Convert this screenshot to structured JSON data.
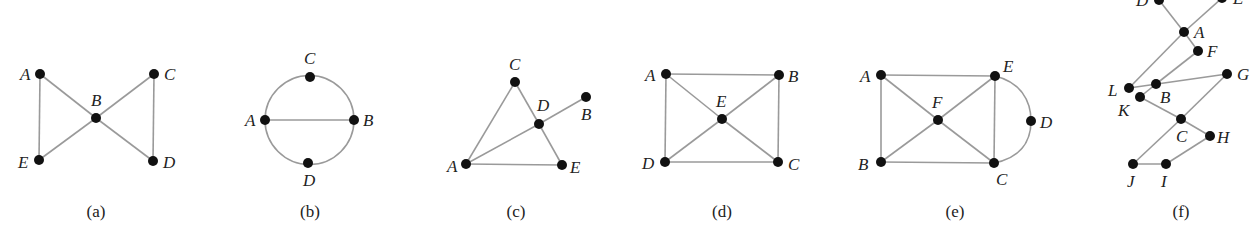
{
  "figure": {
    "graphs": [
      {
        "id": "a",
        "caption": "(a)",
        "caption_pos": [
          96,
          217
        ],
        "vertices": [
          {
            "name": "A",
            "x": 40,
            "y": 74,
            "lx": 20,
            "ly": 80
          },
          {
            "name": "B",
            "x": 96,
            "y": 118,
            "lx": 91,
            "ly": 106
          },
          {
            "name": "C",
            "x": 154,
            "y": 74,
            "lx": 164,
            "ly": 80
          },
          {
            "name": "D",
            "x": 153,
            "y": 161,
            "lx": 163,
            "ly": 168
          },
          {
            "name": "E",
            "x": 39,
            "y": 160,
            "lx": 18,
            "ly": 168
          }
        ],
        "edges": [
          [
            "A",
            "B"
          ],
          [
            "A",
            "E"
          ],
          [
            "B",
            "E"
          ],
          [
            "B",
            "C"
          ],
          [
            "B",
            "D"
          ],
          [
            "C",
            "D"
          ]
        ],
        "arcs": []
      },
      {
        "id": "b",
        "caption": "(b)",
        "caption_pos": [
          310,
          217
        ],
        "vertices": [
          {
            "name": "C",
            "x": 310,
            "y": 77,
            "lx": 304,
            "ly": 64
          },
          {
            "name": "A",
            "x": 265,
            "y": 120,
            "lx": 245,
            "ly": 126
          },
          {
            "name": "B",
            "x": 354,
            "y": 120,
            "lx": 363,
            "ly": 126
          },
          {
            "name": "D",
            "x": 308,
            "y": 163,
            "lx": 303,
            "ly": 186
          }
        ],
        "edges": [
          [
            "A",
            "B"
          ]
        ],
        "circle": {
          "cx": 309.5,
          "cy": 120,
          "r": 44.5
        }
      },
      {
        "id": "c",
        "caption": "(c)",
        "caption_pos": [
          516,
          217
        ],
        "vertices": [
          {
            "name": "C",
            "x": 515,
            "y": 82,
            "lx": 509,
            "ly": 70
          },
          {
            "name": "D",
            "x": 539,
            "y": 124,
            "lx": 537,
            "ly": 111
          },
          {
            "name": "B",
            "x": 586,
            "y": 97,
            "lx": 581,
            "ly": 120
          },
          {
            "name": "A",
            "x": 466,
            "y": 164,
            "lx": 447,
            "ly": 172
          },
          {
            "name": "E",
            "x": 562,
            "y": 165,
            "lx": 570,
            "ly": 173
          }
        ],
        "edges": [
          [
            "A",
            "C"
          ],
          [
            "C",
            "D"
          ],
          [
            "D",
            "E"
          ],
          [
            "A",
            "D"
          ],
          [
            "D",
            "B"
          ],
          [
            "A",
            "E"
          ]
        ],
        "arcs": []
      },
      {
        "id": "d",
        "caption": "(d)",
        "caption_pos": [
          722,
          217
        ],
        "vertices": [
          {
            "name": "A",
            "x": 666,
            "y": 74,
            "lx": 645,
            "ly": 81
          },
          {
            "name": "B",
            "x": 779,
            "y": 75,
            "lx": 788,
            "ly": 82
          },
          {
            "name": "E",
            "x": 722,
            "y": 119,
            "lx": 716,
            "ly": 107
          },
          {
            "name": "D",
            "x": 665,
            "y": 162,
            "lx": 642,
            "ly": 169
          },
          {
            "name": "C",
            "x": 778,
            "y": 162,
            "lx": 788,
            "ly": 170
          }
        ],
        "edges": [
          [
            "A",
            "B"
          ],
          [
            "A",
            "D"
          ],
          [
            "B",
            "C"
          ],
          [
            "D",
            "C"
          ],
          [
            "A",
            "E"
          ],
          [
            "E",
            "C"
          ],
          [
            "B",
            "E"
          ],
          [
            "E",
            "D"
          ]
        ],
        "arcs": []
      },
      {
        "id": "e",
        "caption": "(e)",
        "caption_pos": [
          955,
          217
        ],
        "vertices": [
          {
            "name": "A",
            "x": 881,
            "y": 75,
            "lx": 860,
            "ly": 82
          },
          {
            "name": "E",
            "x": 995,
            "y": 76,
            "lx": 1003,
            "ly": 72
          },
          {
            "name": "F",
            "x": 938,
            "y": 120,
            "lx": 932,
            "ly": 108
          },
          {
            "name": "D",
            "x": 1031,
            "y": 121,
            "lx": 1040,
            "ly": 128
          },
          {
            "name": "B",
            "x": 881,
            "y": 162,
            "lx": 858,
            "ly": 170
          },
          {
            "name": "C",
            "x": 994,
            "y": 163,
            "lx": 996,
            "ly": 185
          }
        ],
        "edges": [
          [
            "A",
            "E"
          ],
          [
            "A",
            "B"
          ],
          [
            "B",
            "C"
          ],
          [
            "E",
            "C"
          ],
          [
            "A",
            "F"
          ],
          [
            "F",
            "C"
          ],
          [
            "E",
            "F"
          ],
          [
            "F",
            "B"
          ]
        ],
        "arcs_path": "M 995 76 C 1020 82, 1031 100, 1031 121 C 1031 142, 1020 158, 994 163"
      },
      {
        "id": "f",
        "caption": "(f)",
        "caption_pos": [
          1181,
          217
        ],
        "vertices": [
          {
            "name": "D",
            "x": 1159,
            "y": 0,
            "lx": 1136,
            "ly": 6
          },
          {
            "name": "E",
            "x": 1222,
            "y": -2,
            "lx": 1233,
            "ly": 4
          },
          {
            "name": "A",
            "x": 1184,
            "y": 32,
            "lx": 1194,
            "ly": 38
          },
          {
            "name": "F",
            "x": 1198,
            "y": 51,
            "lx": 1207,
            "ly": 57
          },
          {
            "name": "G",
            "x": 1227,
            "y": 74,
            "lx": 1237,
            "ly": 80
          },
          {
            "name": "L",
            "x": 1129,
            "y": 88,
            "lx": 1108,
            "ly": 96
          },
          {
            "name": "B",
            "x": 1156,
            "y": 84,
            "lx": 1160,
            "ly": 103
          },
          {
            "name": "K",
            "x": 1140,
            "y": 97,
            "lx": 1118,
            "ly": 116
          },
          {
            "name": "C",
            "x": 1181,
            "y": 119,
            "lx": 1176,
            "ly": 142
          },
          {
            "name": "H",
            "x": 1210,
            "y": 136,
            "lx": 1217,
            "ly": 143
          },
          {
            "name": "J",
            "x": 1133,
            "y": 164,
            "lx": 1127,
            "ly": 187
          },
          {
            "name": "I",
            "x": 1166,
            "y": 164,
            "lx": 1161,
            "ly": 187
          }
        ],
        "edges": [
          [
            "D",
            "A"
          ],
          [
            "E",
            "A"
          ],
          [
            "A",
            "L"
          ],
          [
            "A",
            "F"
          ],
          [
            "F",
            "B"
          ],
          [
            "L",
            "G"
          ],
          [
            "B",
            "K"
          ],
          [
            "K",
            "C"
          ],
          [
            "C",
            "G"
          ],
          [
            "C",
            "H"
          ],
          [
            "C",
            "J"
          ],
          [
            "J",
            "I"
          ],
          [
            "I",
            "H"
          ]
        ],
        "arcs": []
      }
    ]
  }
}
